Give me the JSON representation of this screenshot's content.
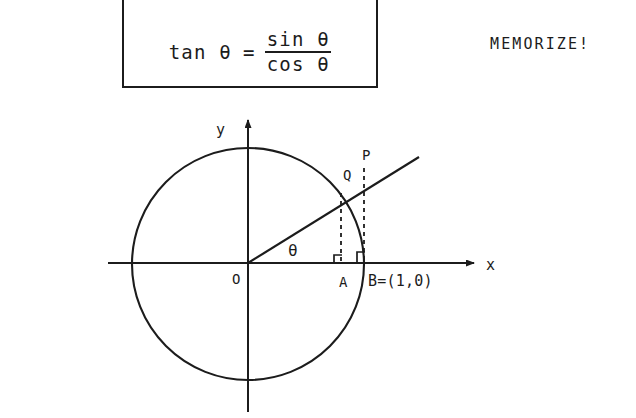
{
  "page": {
    "background_color": "#ffffff",
    "ink_color": "#1c1c1c",
    "width": 636,
    "height": 418
  },
  "formula": {
    "lhs": "tan θ",
    "equals": "=",
    "numerator": "sin θ",
    "denominator": "cos θ",
    "full_text": "tan θ = sin θ / cos θ",
    "boxed": true
  },
  "note": {
    "text": "MEMORIZE!"
  },
  "diagram": {
    "axes": {
      "x_label": "x",
      "y_label": "y",
      "origin_label": "O"
    },
    "angle_label": "θ",
    "points": [
      {
        "name": "point-p-label",
        "label": "P",
        "description": "intersection of terminal ray with vertical tangent line at B"
      },
      {
        "name": "point-q-label",
        "label": "Q",
        "description": "intersection of terminal ray with unit circle"
      },
      {
        "name": "point-a-label",
        "label": "A",
        "description": "foot of perpendicular from Q to x-axis"
      },
      {
        "name": "point-b-label",
        "label": "B=(1,0)",
        "description": "unit point on positive x-axis"
      }
    ],
    "elements": {
      "circle": "unit circle centred at origin",
      "ray": "terminal side of angle theta from origin through Q to P",
      "dashed_q": "dashed segment from Q down to A",
      "dashed_p": "dashed segment from P down to B",
      "right_angles": 2
    },
    "geometry": {
      "center_x": 248,
      "center_y": 264,
      "radius": 116,
      "theta_degrees": 37,
      "x_axis_y": 263,
      "y_axis_x": 248,
      "x_axis_start": 108,
      "x_axis_end": 478,
      "y_axis_top": 116,
      "y_axis_bottom": 412,
      "q_x": 341,
      "q_y": 193,
      "a_x": 341,
      "a_y": 263,
      "p_x": 364,
      "p_y": 175,
      "b_x": 364,
      "b_y": 263,
      "ray_end_x": 419,
      "ray_end_y": 157
    }
  }
}
